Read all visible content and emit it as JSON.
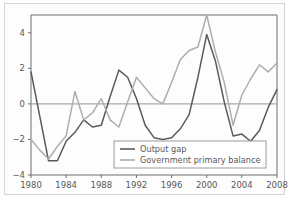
{
  "chart_data": {
    "type": "line",
    "title": "",
    "xlabel": "",
    "ylabel": "",
    "xlim": [
      1980,
      2008
    ],
    "ylim": [
      -4,
      5
    ],
    "yticks": [
      -4,
      -2,
      0,
      2,
      4
    ],
    "ytick_labels": [
      "−4",
      "−2",
      "0",
      "2",
      "4"
    ],
    "xticks": [
      1980,
      1984,
      1988,
      1992,
      1996,
      2000,
      2004,
      2008
    ],
    "xtick_labels": [
      "1980",
      "1984",
      "1988",
      "1992",
      "1996",
      "2000",
      "2004",
      "2008"
    ],
    "grid": false,
    "zero_line": 0,
    "legend_position": "bottom-right",
    "x": [
      1980,
      1981,
      1982,
      1983,
      1984,
      1985,
      1986,
      1987,
      1988,
      1989,
      1990,
      1991,
      1992,
      1993,
      1994,
      1995,
      1996,
      1997,
      1998,
      1999,
      2000,
      2001,
      2002,
      2003,
      2004,
      2005,
      2006,
      2007,
      2008
    ],
    "series": [
      {
        "name": "Output gap",
        "color": "#5a5a5c",
        "values": [
          1.8,
          -0.7,
          -3.2,
          -3.2,
          -2.1,
          -1.6,
          -0.9,
          -1.3,
          -1.2,
          0.4,
          1.9,
          1.5,
          0.3,
          -1.2,
          -1.9,
          -2.0,
          -1.9,
          -1.4,
          -0.6,
          1.5,
          3.9,
          2.4,
          0.1,
          -1.8,
          -1.7,
          -2.1,
          -1.5,
          -0.2,
          0.8
        ]
      },
      {
        "name": "Government primary balance",
        "color": "#aeaeb0",
        "values": [
          -2.0,
          -2.6,
          -3.1,
          -2.4,
          -1.8,
          0.7,
          -0.9,
          -0.5,
          0.3,
          -0.9,
          -1.3,
          0.1,
          1.5,
          0.9,
          0.3,
          0.0,
          1.2,
          2.5,
          3.0,
          3.2,
          5.0,
          2.9,
          1.2,
          -1.2,
          0.5,
          1.4,
          2.2,
          1.8,
          2.3
        ]
      }
    ]
  },
  "legend": {
    "items": [
      {
        "label": "Output gap",
        "color": "#5a5a5c"
      },
      {
        "label": "Government primary balance",
        "color": "#aeaeb0"
      }
    ]
  },
  "colors": {
    "output_gap": "#5a5a5c",
    "primary_balance": "#aeaeb0",
    "axis": "#6d6d6f",
    "zero_line": "#a8a8aa",
    "legend_border": "#9a9a9c",
    "frame": "#d4d4d4",
    "background": "#fdfdfd"
  }
}
